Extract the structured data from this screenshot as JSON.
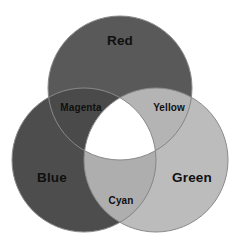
{
  "figure": {
    "background_color": "#ffffff",
    "width": 243,
    "height": 250
  },
  "chart_data": {
    "type": "diagram",
    "diagram_type": "venn-3-set",
    "title": "",
    "sets": [
      {
        "name": "Red",
        "label": "Red",
        "cx": 120,
        "cy": 88,
        "r": 72,
        "fill": "#595959",
        "label_x": 120,
        "label_y": 41
      },
      {
        "name": "Blue",
        "label": "Blue",
        "cx": 84,
        "cy": 160,
        "r": 72,
        "fill": "#4d4d4d",
        "label_x": 52,
        "label_y": 178
      },
      {
        "name": "Green",
        "label": "Green",
        "cx": 156,
        "cy": 160,
        "r": 72,
        "fill": "#bcbcbc",
        "label_x": 192,
        "label_y": 178
      }
    ],
    "intersections": [
      {
        "name": "Magenta",
        "label": "Magenta",
        "of": [
          "Red",
          "Blue"
        ],
        "fill": "#4a4a4a",
        "label_x": 81,
        "label_y": 108
      },
      {
        "name": "Yellow",
        "label": "Yellow",
        "of": [
          "Red",
          "Green"
        ],
        "fill": "#b4b4b4",
        "label_x": 169,
        "label_y": 108
      },
      {
        "name": "Cyan",
        "label": "Cyan",
        "of": [
          "Blue",
          "Green"
        ],
        "fill": "#aeaeae",
        "label_x": 121,
        "label_y": 201
      },
      {
        "name": "White",
        "label": "",
        "of": [
          "Red",
          "Green",
          "Blue"
        ],
        "fill": "#ffffff",
        "label_x": 120,
        "label_y": 145
      }
    ],
    "outline_color": "#8a8a8a",
    "label_color": "#101010"
  }
}
